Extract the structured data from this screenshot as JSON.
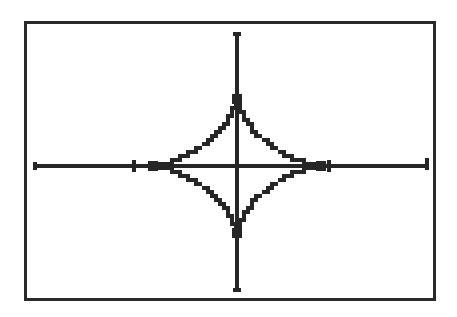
{
  "screen": {
    "label": "graphing-calculator-display",
    "background_color": "#ffffff",
    "border_color": "#2a2a2a",
    "ink_color": "#262626",
    "border_width_px": 3,
    "width_px": 457,
    "height_px": 317
  },
  "chart_data": {
    "type": "line",
    "title": "",
    "subtitle": "",
    "xlabel": "",
    "ylabel": "",
    "grid": false,
    "legend": "none",
    "curve_name": "astroid",
    "equation": "x^(2/3) + y^(2/3) = a^(2/3)",
    "parametric": {
      "x": "a*cos(t)^3",
      "y": "a*sin(t)^3",
      "t_range": [
        0,
        6.283185
      ]
    },
    "axis_style": "crosshair-with-end-caps",
    "xlim": [
      -4.7,
      4.7
    ],
    "ylim": [
      -3.1,
      3.1
    ],
    "x_tick_values": [
      -2,
      2
    ],
    "y_tick_values": [],
    "x_tick_labels": [
      "",
      ""
    ],
    "y_tick_labels": [],
    "series": [
      {
        "name": "astroid",
        "color": "#262626",
        "cusps": [
          {
            "label": "right-cusp",
            "x": 2.0,
            "y": 0.0
          },
          {
            "label": "top-cusp",
            "x": 0.0,
            "y": 1.6
          },
          {
            "label": "left-cusp",
            "x": -2.0,
            "y": 0.0
          },
          {
            "label": "bottom-cusp",
            "x": 0.0,
            "y": -1.6
          }
        ],
        "points": [
          {
            "x": 2.0,
            "y": 0.0
          },
          {
            "x": 1.96,
            "y": 0.0125
          },
          {
            "x": 1.85,
            "y": 0.095
          },
          {
            "x": 1.68,
            "y": 0.24
          },
          {
            "x": 1.45,
            "y": 0.42
          },
          {
            "x": 1.19,
            "y": 0.61
          },
          {
            "x": 0.92,
            "y": 0.8
          },
          {
            "x": 0.66,
            "y": 0.98
          },
          {
            "x": 0.43,
            "y": 1.17
          },
          {
            "x": 0.24,
            "y": 1.33
          },
          {
            "x": 0.1,
            "y": 1.47
          },
          {
            "x": 0.025,
            "y": 1.56
          },
          {
            "x": 0.0,
            "y": 1.6
          },
          {
            "x": -0.025,
            "y": 1.56
          },
          {
            "x": -0.1,
            "y": 1.47
          },
          {
            "x": -0.24,
            "y": 1.33
          },
          {
            "x": -0.43,
            "y": 1.17
          },
          {
            "x": -0.66,
            "y": 0.98
          },
          {
            "x": -0.92,
            "y": 0.8
          },
          {
            "x": -1.19,
            "y": 0.61
          },
          {
            "x": -1.45,
            "y": 0.42
          },
          {
            "x": -1.68,
            "y": 0.24
          },
          {
            "x": -1.85,
            "y": 0.095
          },
          {
            "x": -1.96,
            "y": 0.0125
          },
          {
            "x": -2.0,
            "y": 0.0
          },
          {
            "x": -1.96,
            "y": -0.0125
          },
          {
            "x": -1.85,
            "y": -0.095
          },
          {
            "x": -1.68,
            "y": -0.24
          },
          {
            "x": -1.45,
            "y": -0.42
          },
          {
            "x": -1.19,
            "y": -0.61
          },
          {
            "x": -0.92,
            "y": -0.8
          },
          {
            "x": -0.66,
            "y": -0.98
          },
          {
            "x": -0.43,
            "y": -1.17
          },
          {
            "x": -0.24,
            "y": -1.33
          },
          {
            "x": -0.1,
            "y": -1.47
          },
          {
            "x": -0.025,
            "y": -1.56
          },
          {
            "x": 0.0,
            "y": -1.6
          },
          {
            "x": 0.025,
            "y": -1.56
          },
          {
            "x": 0.1,
            "y": -1.47
          },
          {
            "x": 0.24,
            "y": -1.33
          },
          {
            "x": 0.43,
            "y": -1.17
          },
          {
            "x": 0.66,
            "y": -0.98
          },
          {
            "x": 0.92,
            "y": -0.8
          },
          {
            "x": 1.19,
            "y": -0.61
          },
          {
            "x": 1.45,
            "y": -0.42
          },
          {
            "x": 1.68,
            "y": -0.24
          },
          {
            "x": 1.85,
            "y": -0.095
          },
          {
            "x": 1.96,
            "y": -0.0125
          },
          {
            "x": 2.0,
            "y": 0.0
          }
        ]
      }
    ],
    "markers": [
      {
        "name": "top-cusp-marker",
        "x": 0.0,
        "y": 1.6
      },
      {
        "name": "bottom-cusp-marker",
        "x": 0.0,
        "y": -1.6
      },
      {
        "name": "left-cusp-marker",
        "x": -2.0,
        "y": 0.0
      },
      {
        "name": "right-cusp-marker",
        "x": 2.0,
        "y": 0.0
      }
    ]
  },
  "geometry": {
    "origin_px": {
      "x": 237,
      "y": 166
    },
    "x_axis_px": {
      "left": 34,
      "right": 428,
      "y": 166
    },
    "y_axis_px": {
      "top": 33,
      "bottom": 291,
      "x": 237
    },
    "scale_px_per_unit": {
      "x": 42.0,
      "y": 42.0
    },
    "x_ticks_px": [
      134,
      329
    ],
    "end_cap_length_px": 8
  }
}
